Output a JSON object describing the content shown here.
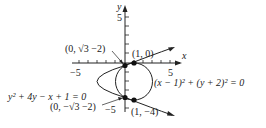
{
  "diagram": {
    "axes": {
      "x_label": "x",
      "y_label": "y",
      "x_tick_neg": "−5",
      "x_tick_pos": "5",
      "y_tick_pos": "5",
      "y_tick_neg": "−5"
    },
    "curves": {
      "parabola_equation": "y² + 4y − x + 1 = 0",
      "circle_equation": "(x − 1)² + (y + 2)² = 0"
    },
    "points": [
      {
        "label": "(0, √3 −2)"
      },
      {
        "label": "(1, 0)"
      },
      {
        "label": "(0, −√3 −2)"
      },
      {
        "label": "(1, −4)"
      }
    ],
    "colors": {
      "ink": "#222222",
      "background": "#ffffff"
    }
  }
}
